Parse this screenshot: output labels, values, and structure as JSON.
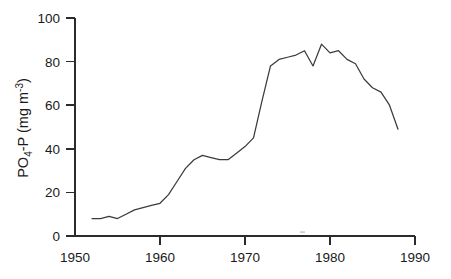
{
  "figure": {
    "name": "po4-p-time-series",
    "background_color": "#ffffff",
    "line_color": "#3b3b3b",
    "axis_color": "#2b2b2b"
  },
  "axis_title": {
    "y_parts": {
      "lead": "PO",
      "sub1": "4",
      "mid": "-P  (mg m",
      "sup1": "-3",
      "tail": ")"
    },
    "y_plain": "PO4-P (mg m-3)",
    "x_plain": ""
  },
  "ticks": {
    "y": [
      "0",
      "20",
      "40",
      "60",
      "80",
      "100"
    ],
    "x": [
      "1950",
      "1960",
      "1970",
      "1980",
      "1990"
    ]
  },
  "chart_data": {
    "type": "line",
    "title": "",
    "subtitle": "",
    "xlabel": "",
    "ylabel": "PO4-P (mg m-3)",
    "xlim": [
      1950,
      1990
    ],
    "ylim": [
      0,
      100
    ],
    "xticks": [
      1950,
      1960,
      1970,
      1980,
      1990
    ],
    "yticks": [
      0,
      20,
      40,
      60,
      80,
      100
    ],
    "grid": false,
    "legend": false,
    "legend_position": "none",
    "series": [
      {
        "name": "PO4-P",
        "color": "#3b3b3b",
        "x": [
          1952,
          1953,
          1954,
          1955,
          1956,
          1957,
          1958,
          1959,
          1960,
          1961,
          1962,
          1963,
          1964,
          1965,
          1966,
          1967,
          1968,
          1969,
          1970,
          1971,
          1972,
          1973,
          1974,
          1975,
          1976,
          1977,
          1978,
          1979,
          1980,
          1981,
          1982,
          1983,
          1984,
          1985,
          1986,
          1987,
          1988
        ],
        "values": [
          8,
          8,
          9,
          8,
          10,
          12,
          13,
          14,
          15,
          19,
          25,
          31,
          35,
          37,
          36,
          35,
          35,
          38,
          41,
          45,
          62,
          78,
          81,
          82,
          83,
          85,
          78,
          88,
          84,
          85,
          81,
          79,
          72,
          68,
          66,
          60,
          49
        ]
      }
    ]
  }
}
